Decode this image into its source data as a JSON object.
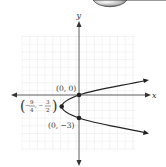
{
  "diagram": {
    "type": "graph-of-parabola",
    "axes": {
      "x_label": "x",
      "y_label": "y"
    },
    "points": [
      {
        "label": "(0, 0)",
        "x": 0,
        "y": 0
      },
      {
        "label": "(0, −3)",
        "x": 0,
        "y": -3
      },
      {
        "label_num_x": "9",
        "label_den_x": "4",
        "label_num_y": "3",
        "label_den_y": "2",
        "x": -2.25,
        "y": -1.5,
        "role": "vertex"
      }
    ],
    "labels": {
      "origin": "(0, 0)",
      "point_b": "(0, −3)",
      "vertex_prefix": "−",
      "vertex_x_num": "9",
      "vertex_x_den": "4",
      "vertex_sep": ", −",
      "vertex_y_num": "3",
      "vertex_y_den": "2"
    },
    "colors": {
      "curve": "#222222",
      "axis": "#333333",
      "grid": "#e6e6e6"
    }
  }
}
